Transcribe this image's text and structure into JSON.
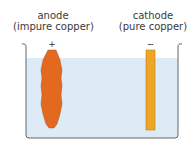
{
  "diagram": {
    "type": "electrolysis-purification-of-copper",
    "anode": {
      "name": "anode",
      "material": "(impure copper)",
      "sign": "+",
      "color": "#e2691f"
    },
    "cathode": {
      "name": "cathode",
      "material": "(pure copper)",
      "sign": "−",
      "color": "#f0a526"
    },
    "electrolyte_color": "#dcebf5",
    "beaker_color": "#555555"
  }
}
